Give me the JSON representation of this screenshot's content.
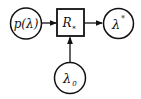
{
  "diagram": {
    "type": "block-diagram",
    "nodes": [
      {
        "id": "input",
        "shape": "circle",
        "label": "p(λ)"
      },
      {
        "id": "block",
        "shape": "square",
        "label": "R",
        "subscript": "*"
      },
      {
        "id": "output",
        "shape": "circle",
        "label": "λ",
        "superscript": "*"
      },
      {
        "id": "param",
        "shape": "circle",
        "label": "λ",
        "subscript": "0"
      }
    ],
    "edges": [
      {
        "from": "input",
        "to": "block"
      },
      {
        "from": "block",
        "to": "output"
      },
      {
        "from": "param",
        "to": "block"
      }
    ],
    "colors": {
      "stroke": "#111111",
      "background": "#ffffff"
    }
  }
}
